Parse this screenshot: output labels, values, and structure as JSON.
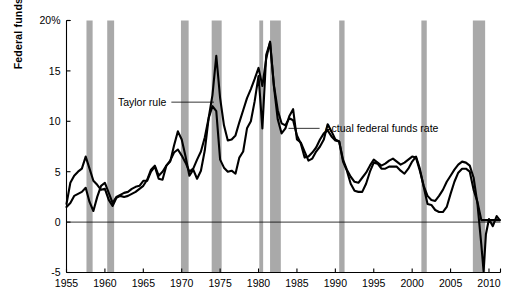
{
  "chart_data": {
    "type": "line",
    "title": "",
    "xlabel": "",
    "ylabel": "Federal funds rate",
    "ylim": [
      -5,
      20
    ],
    "xlim": [
      1955,
      2011.5
    ],
    "grid": false,
    "legend_position": "inline-annotations",
    "ytick_labels": [
      "20%",
      "15",
      "10",
      "5",
      "0",
      "-5"
    ],
    "ytick_values": [
      20,
      15,
      10,
      5,
      0,
      -5
    ],
    "xtick_labels": [
      "1955",
      "1960",
      "1965",
      "1970",
      "1975",
      "1980",
      "1985",
      "1990",
      "1995",
      "2000",
      "2005",
      "2010"
    ],
    "xtick_values": [
      1955,
      1960,
      1965,
      1970,
      1975,
      1980,
      1985,
      1990,
      1995,
      2000,
      2005,
      2010
    ],
    "zero_line": 0,
    "annotations": [
      {
        "text": "Taylor rule",
        "x": 1968.0,
        "y": 11.9,
        "leader_to_x": 1974.2,
        "leader_to_y": 11.9
      },
      {
        "text": "Actual federal funds rate",
        "x": 1988.6,
        "y": 9.3,
        "leader_to_x": 1983.9,
        "leader_to_y": 9.3
      }
    ],
    "shaded_bands_label": "recession",
    "shaded_bands": [
      {
        "start": 1957.6,
        "end": 1958.4
      },
      {
        "start": 1960.3,
        "end": 1961.2
      },
      {
        "start": 1969.9,
        "end": 1970.9
      },
      {
        "start": 1973.9,
        "end": 1975.2
      },
      {
        "start": 1980.1,
        "end": 1980.6
      },
      {
        "start": 1981.5,
        "end": 1982.9
      },
      {
        "start": 1990.5,
        "end": 1991.2
      },
      {
        "start": 2001.2,
        "end": 2001.9
      },
      {
        "start": 2007.9,
        "end": 2009.5
      }
    ],
    "series": [
      {
        "name": "Taylor rule",
        "color": "#000000",
        "x": [
          1955.0,
          1955.5,
          1956.0,
          1956.5,
          1957.0,
          1957.5,
          1958.0,
          1958.5,
          1959.0,
          1959.5,
          1960.0,
          1960.5,
          1961.0,
          1961.5,
          1962.0,
          1962.5,
          1963.0,
          1963.5,
          1964.0,
          1964.5,
          1965.0,
          1965.5,
          1966.0,
          1966.5,
          1967.0,
          1967.5,
          1968.0,
          1968.5,
          1969.0,
          1969.5,
          1970.0,
          1970.5,
          1971.0,
          1971.5,
          1972.0,
          1972.5,
          1973.0,
          1973.5,
          1974.0,
          1974.5,
          1975.0,
          1975.5,
          1976.0,
          1976.5,
          1977.0,
          1977.5,
          1978.0,
          1978.5,
          1979.0,
          1979.5,
          1980.0,
          1980.5,
          1981.0,
          1981.5,
          1982.0,
          1982.5,
          1983.0,
          1983.5,
          1984.0,
          1984.5,
          1985.0,
          1985.5,
          1986.0,
          1986.5,
          1987.0,
          1987.5,
          1988.0,
          1988.5,
          1989.0,
          1989.5,
          1990.0,
          1990.5,
          1991.0,
          1991.5,
          1992.0,
          1992.5,
          1993.0,
          1993.5,
          1994.0,
          1994.5,
          1995.0,
          1995.5,
          1996.0,
          1996.5,
          1997.0,
          1997.5,
          1998.0,
          1998.5,
          1999.0,
          1999.5,
          2000.0,
          2000.5,
          2001.0,
          2001.5,
          2002.0,
          2002.5,
          2003.0,
          2003.5,
          2004.0,
          2004.5,
          2005.0,
          2005.5,
          2006.0,
          2006.5,
          2007.0,
          2007.5,
          2008.0,
          2008.5,
          2009.0,
          2009.3,
          2009.6,
          2010.0,
          2010.5,
          2011.0,
          2011.4
        ],
        "y": [
          1.8,
          3.9,
          4.6,
          5.0,
          5.3,
          6.5,
          5.3,
          4.1,
          3.7,
          3.2,
          3.3,
          2.2,
          1.6,
          2.4,
          2.6,
          2.5,
          2.6,
          2.8,
          3.0,
          3.3,
          3.6,
          4.2,
          5.2,
          5.6,
          4.6,
          5.0,
          5.6,
          6.1,
          6.9,
          7.2,
          6.6,
          5.9,
          5.0,
          5.3,
          6.2,
          7.0,
          8.4,
          10.3,
          12.6,
          16.5,
          12.3,
          9.6,
          8.1,
          8.2,
          8.6,
          9.9,
          11.1,
          12.3,
          13.2,
          14.2,
          15.3,
          13.5,
          16.2,
          17.9,
          13.6,
          11.1,
          9.8,
          9.6,
          10.3,
          10.1,
          8.6,
          7.8,
          6.4,
          6.5,
          6.9,
          7.4,
          8.2,
          8.8,
          9.1,
          8.5,
          8.1,
          8.0,
          6.2,
          5.2,
          4.5,
          4.0,
          3.9,
          4.4,
          4.9,
          5.6,
          6.2,
          5.9,
          5.6,
          5.8,
          6.1,
          6.3,
          6.0,
          5.7,
          5.9,
          6.2,
          6.5,
          6.4,
          5.1,
          3.6,
          2.6,
          2.2,
          2.1,
          2.6,
          3.2,
          4.0,
          4.6,
          5.2,
          5.7,
          6.0,
          5.9,
          5.6,
          4.4,
          1.8,
          -2.2,
          -4.9,
          -1.2,
          0.3,
          -0.4,
          0.6,
          0.2
        ]
      },
      {
        "name": "Actual federal funds rate",
        "color": "#000000",
        "x": [
          1955.0,
          1955.5,
          1956.0,
          1956.5,
          1957.0,
          1957.5,
          1958.0,
          1958.5,
          1959.0,
          1959.5,
          1960.0,
          1960.5,
          1961.0,
          1961.5,
          1962.0,
          1962.5,
          1963.0,
          1963.5,
          1964.0,
          1964.5,
          1965.0,
          1965.5,
          1966.0,
          1966.5,
          1967.0,
          1967.5,
          1968.0,
          1968.5,
          1969.0,
          1969.5,
          1970.0,
          1970.5,
          1971.0,
          1971.5,
          1972.0,
          1972.5,
          1973.0,
          1973.5,
          1974.0,
          1974.5,
          1975.0,
          1975.5,
          1976.0,
          1976.5,
          1977.0,
          1977.5,
          1978.0,
          1978.5,
          1979.0,
          1979.5,
          1980.0,
          1980.5,
          1981.0,
          1981.5,
          1982.0,
          1982.5,
          1983.0,
          1983.5,
          1984.0,
          1984.5,
          1985.0,
          1985.5,
          1986.0,
          1986.5,
          1987.0,
          1987.5,
          1988.0,
          1988.5,
          1989.0,
          1989.5,
          1990.0,
          1990.5,
          1991.0,
          1991.5,
          1992.0,
          1992.5,
          1993.0,
          1993.5,
          1994.0,
          1994.5,
          1995.0,
          1995.5,
          1996.0,
          1996.5,
          1997.0,
          1997.5,
          1998.0,
          1998.5,
          1999.0,
          1999.5,
          2000.0,
          2000.5,
          2001.0,
          2001.5,
          2002.0,
          2002.5,
          2003.0,
          2003.5,
          2004.0,
          2004.5,
          2005.0,
          2005.5,
          2006.0,
          2006.5,
          2007.0,
          2007.5,
          2008.0,
          2008.5,
          2009.0,
          2009.5,
          2010.0,
          2010.5,
          2011.0,
          2011.4
        ],
        "y": [
          1.5,
          1.9,
          2.6,
          2.8,
          3.0,
          3.4,
          2.0,
          1.1,
          2.5,
          3.6,
          3.9,
          2.9,
          1.9,
          2.5,
          2.7,
          2.9,
          3.0,
          3.3,
          3.5,
          3.6,
          4.1,
          4.1,
          5.0,
          5.5,
          4.3,
          4.2,
          5.6,
          6.0,
          7.6,
          9.0,
          8.2,
          6.5,
          4.6,
          5.2,
          4.3,
          5.1,
          7.1,
          10.3,
          11.5,
          11.0,
          6.2,
          5.4,
          5.0,
          5.1,
          4.8,
          6.4,
          7.0,
          9.3,
          10.0,
          12.0,
          14.5,
          9.3,
          16.6,
          17.8,
          13.5,
          10.2,
          8.8,
          9.3,
          10.5,
          11.2,
          8.2,
          7.9,
          7.0,
          6.1,
          6.3,
          7.0,
          7.5,
          8.2,
          9.7,
          9.0,
          8.2,
          8.0,
          6.0,
          5.1,
          3.8,
          3.1,
          3.0,
          3.0,
          3.8,
          5.0,
          5.9,
          5.8,
          5.3,
          5.3,
          5.5,
          5.5,
          5.5,
          5.1,
          4.8,
          5.3,
          6.0,
          6.5,
          5.3,
          3.5,
          1.8,
          1.7,
          1.2,
          1.0,
          1.0,
          1.5,
          2.8,
          4.0,
          4.9,
          5.3,
          5.3,
          5.0,
          3.2,
          2.0,
          0.2,
          0.2,
          0.2,
          0.2,
          0.2,
          0.2
        ]
      }
    ]
  },
  "axis": {
    "y_title": "Federal funds rate"
  }
}
